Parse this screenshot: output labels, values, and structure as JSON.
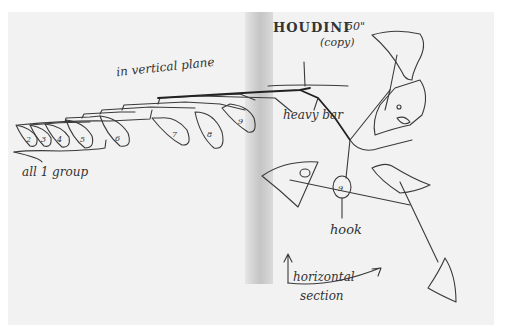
{
  "image": {
    "description": "Hand-drawn pen sketch of a hanging mobile on light gray paper with a vertical fold shadow",
    "colors": {
      "paper": "#f2f2f2",
      "ink": "#333333",
      "background": "#ffffff",
      "fold": "#c4c4c4"
    }
  },
  "annotations": {
    "title": "HOUDINI",
    "size": "50\"",
    "copy_note": "(copy)",
    "vertical_plane": "in vertical plane",
    "group_note": "all 1 group",
    "heavy_bar": "heavy bar",
    "hook": "hook",
    "horizontal_section_line1": "horizontal",
    "horizontal_section_line2": "section"
  },
  "elements": {
    "numbered_leaves": [
      "2",
      "3",
      "4",
      "5",
      "6",
      "7",
      "8",
      "9"
    ],
    "hook_label_number": "9",
    "joint_number": "5"
  }
}
